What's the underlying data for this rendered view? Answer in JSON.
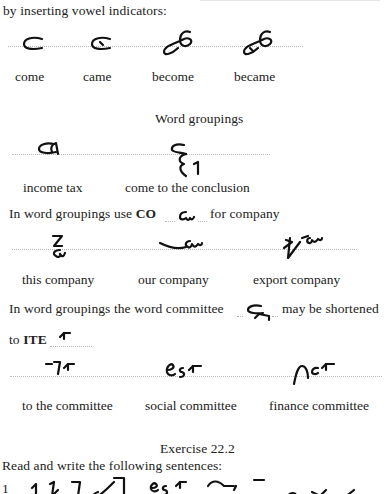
{
  "top_fragment": "by inserting vowel indicators:",
  "vowel_examples": [
    {
      "label": "come",
      "outline": "come-outline"
    },
    {
      "label": "came",
      "outline": "came-outline"
    },
    {
      "label": "become",
      "outline": "become-outline"
    },
    {
      "label": "became",
      "outline": "became-outline"
    }
  ],
  "word_groupings": {
    "heading": "Word groupings",
    "items": [
      {
        "label": "income tax",
        "outline": "income-tax-outline"
      },
      {
        "label": "come to the conclusion",
        "outline": "come-to-the-conclusion-outline"
      }
    ]
  },
  "company_rule": {
    "prefix": "In word groupings use ",
    "bold": "CO",
    "suffix": "for company",
    "items": [
      {
        "label": "this company",
        "outline": "this-company-outline"
      },
      {
        "label": "our company",
        "outline": "our-company-outline"
      },
      {
        "label": "export company",
        "outline": "export-company-outline"
      }
    ]
  },
  "committee_rule": {
    "line1_prefix": "In word groupings the word committee",
    "line1_suffix": "may be shortened",
    "line2_prefix": "to ",
    "line2_bold": "ITE",
    "items": [
      {
        "label": "to the committee",
        "outline": "to-the-committee-outline"
      },
      {
        "label": "social committee",
        "outline": "social-committee-outline"
      },
      {
        "label": "finance committee",
        "outline": "finance-committee-outline"
      }
    ]
  },
  "exercise": {
    "title": "Exercise 22.2",
    "instruction": "Read and write the following sentences:",
    "first_number": "1"
  }
}
